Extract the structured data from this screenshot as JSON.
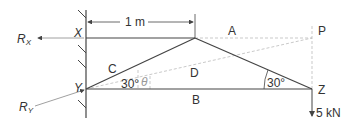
{
  "diagram": {
    "type": "truss-structure",
    "dimension": {
      "label": "1 m"
    },
    "reactions": {
      "rx": {
        "main": "R",
        "sub": "X"
      },
      "ry": {
        "main": "R",
        "sub": "Y"
      }
    },
    "joints": {
      "x": "X",
      "y": "Y",
      "z": "Z",
      "p": "P"
    },
    "members": {
      "a": "A",
      "b": "B",
      "c": "C",
      "d": "D"
    },
    "angles": {
      "at_y": "30°",
      "theta": "θ",
      "at_z": "30°"
    },
    "load": {
      "label": "5 kN"
    },
    "colors": {
      "line": "#444444",
      "dashed": "#bbbbbb",
      "text": "#333333"
    }
  }
}
